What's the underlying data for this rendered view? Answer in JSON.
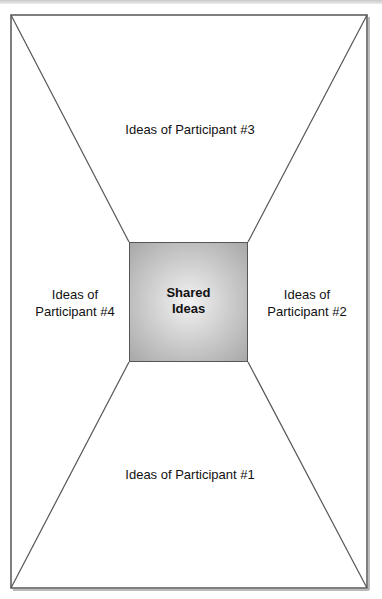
{
  "diagram": {
    "center": {
      "line1": "Shared",
      "line2": "Ideas"
    },
    "participants": {
      "top": "Ideas of Participant #3",
      "left": {
        "line1": "Ideas of",
        "line2": "Participant #4"
      },
      "right": {
        "line1": "Ideas of",
        "line2": "Participant #2"
      },
      "bottom": "Ideas of Participant #1"
    },
    "colors": {
      "line": "#555555",
      "center_fill": "#c9c9c9"
    }
  }
}
